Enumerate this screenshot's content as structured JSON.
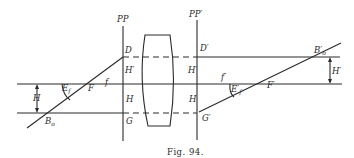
{
  "figure": {
    "caption": "Fig. 94.",
    "labels": {
      "pp": "PP",
      "pp_prime": "PP′",
      "d": "D",
      "d_prime": "D′",
      "h_prime_left": "H′",
      "h_prime_right": "H′",
      "h_left": "H",
      "h_right": "H",
      "g": "G",
      "g_prime": "G′",
      "f_small": "f",
      "f_small_prime": "f′",
      "f_big": "F",
      "f_big_prime": "F′",
      "e": "E",
      "e_sub": "f",
      "e_prime": "E′",
      "e_prime_sub": "f",
      "bo": "B",
      "bo_sub": "o",
      "bo_prime": "B′",
      "bo_prime_sub": "o",
      "h_dim_left": "H",
      "h_dim_right": "H′"
    }
  }
}
